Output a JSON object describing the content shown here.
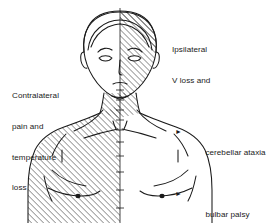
{
  "figure": {
    "title_alt": "Lateral medullary syndrome sensory loss diagram",
    "colors": {
      "background": "#ffffff",
      "ink": "#1a1a1a",
      "hatch": "#262626",
      "text": "#1a1a1a"
    },
    "hatching": {
      "head_side": "right",
      "body_side": "left",
      "angle_deg": 45,
      "spacing_px": 3
    },
    "midline": {
      "x": 120,
      "tick_marks": true
    }
  },
  "annotations": {
    "left": {
      "name": "contralateral-annotation",
      "lines": [
        "Contralateral",
        "pain and",
        "temperature",
        "loss"
      ]
    },
    "right": {
      "name": "ipsilateral-annotation",
      "lines": [
        "Ipsilateral",
        "V loss and"
      ],
      "bullet_glyph": "►",
      "items": [
        "cerebellar ataxia",
        "bulbar palsy",
        "Horner's syndrome"
      ]
    }
  }
}
